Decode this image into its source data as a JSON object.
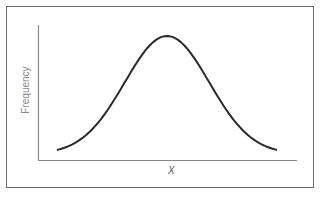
{
  "chart_data": {
    "type": "line",
    "title": "",
    "xlabel": "X",
    "ylabel": "Frequency",
    "x": [
      -3,
      -2.5,
      -2,
      -1.5,
      -1,
      -0.5,
      0,
      0.5,
      1,
      1.5,
      2,
      2.5,
      3
    ],
    "series": [
      {
        "name": "distribution",
        "values": [
          0.004,
          0.018,
          0.054,
          0.13,
          0.242,
          0.352,
          0.399,
          0.352,
          0.242,
          0.13,
          0.054,
          0.018,
          0.004
        ]
      }
    ],
    "grid": false,
    "legend": "none",
    "ticks": "none"
  }
}
